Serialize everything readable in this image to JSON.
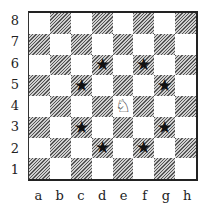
{
  "diagram": {
    "type": "chess-board",
    "ranks": [
      "8",
      "7",
      "6",
      "5",
      "4",
      "3",
      "2",
      "1"
    ],
    "files": [
      "a",
      "b",
      "c",
      "d",
      "e",
      "f",
      "g",
      "h"
    ],
    "pieces": [
      {
        "square": "e4",
        "piece": "knight",
        "color": "white",
        "glyph": "♘"
      }
    ],
    "markers": [
      {
        "square": "d6",
        "glyph": "★"
      },
      {
        "square": "f6",
        "glyph": "★"
      },
      {
        "square": "c5",
        "glyph": "★"
      },
      {
        "square": "g5",
        "glyph": "★"
      },
      {
        "square": "c3",
        "glyph": "★"
      },
      {
        "square": "g3",
        "glyph": "★"
      },
      {
        "square": "d2",
        "glyph": "★"
      },
      {
        "square": "f2",
        "glyph": "★"
      }
    ],
    "colors": {
      "dark_hatch": "#555555",
      "light": "#ffffff",
      "border": "#222222"
    }
  }
}
